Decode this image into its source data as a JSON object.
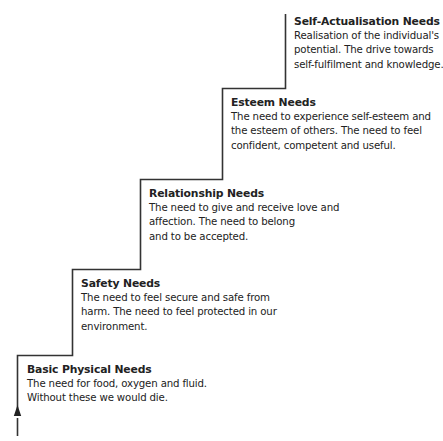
{
  "diagram": {
    "type": "staircase",
    "direction": "ascending-left-to-right",
    "line_color": "#333333",
    "top_cutoff_text": "",
    "steps": [
      {
        "level": 5,
        "title": "Self-Actualisation Needs",
        "lines": [
          "Realisation of the individual's",
          "potential. The drive towards",
          "self-fulfilment and knowledge."
        ]
      },
      {
        "level": 4,
        "title": "Esteem Needs",
        "lines": [
          "The need to experience self-esteem and",
          "the esteem of others. The need to feel",
          "confident, competent and useful."
        ]
      },
      {
        "level": 3,
        "title": "Relationship Needs",
        "lines": [
          "The need to give and receive love and",
          "affection. The need to belong",
          "and to be accepted."
        ]
      },
      {
        "level": 2,
        "title": "Safety Needs",
        "lines": [
          "The need to feel secure and safe from",
          "harm. The need to feel protected in our",
          "environment."
        ]
      },
      {
        "level": 1,
        "title": "Basic Physical Needs",
        "lines": [
          "The need for food, oxygen and fluid.",
          "Without these we would die."
        ]
      }
    ]
  }
}
